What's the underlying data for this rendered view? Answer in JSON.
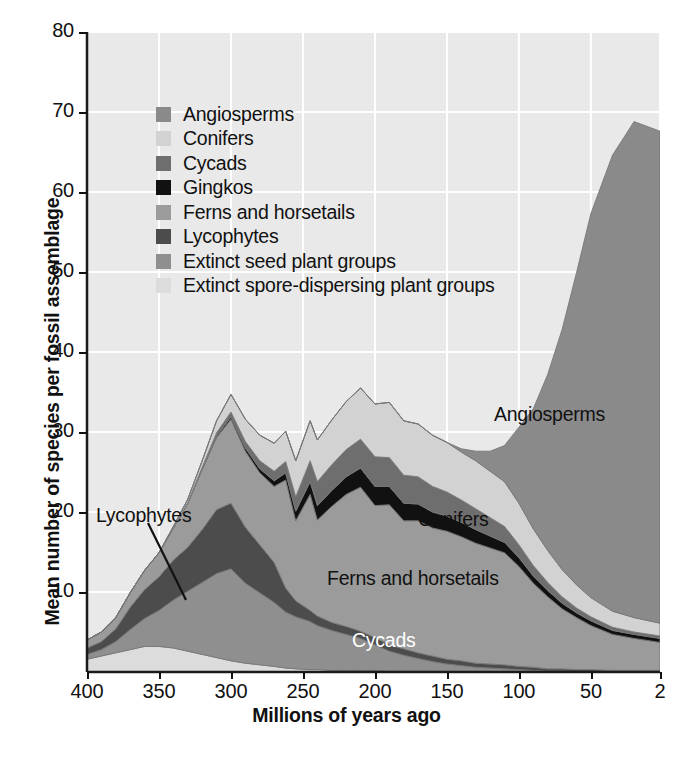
{
  "chart_data": {
    "type": "area",
    "stacked": true,
    "title": "",
    "xlabel": "Millions of years ago",
    "ylabel": "Mean number of species per fossil assemblage",
    "xlim": [
      400,
      2
    ],
    "ylim": [
      0,
      80
    ],
    "x_reversed": true,
    "grid": true,
    "legend_position": "upper-left-inside",
    "xticks": [
      400,
      350,
      300,
      250,
      200,
      150,
      100,
      50,
      2
    ],
    "yticks": [
      10,
      20,
      30,
      40,
      50,
      60,
      70,
      80
    ],
    "x": [
      400,
      390,
      380,
      370,
      360,
      350,
      340,
      330,
      320,
      310,
      300,
      290,
      280,
      270,
      262,
      255,
      245,
      240,
      230,
      220,
      210,
      200,
      190,
      180,
      170,
      160,
      150,
      140,
      130,
      120,
      110,
      100,
      90,
      80,
      70,
      60,
      50,
      35,
      20,
      2
    ],
    "series": [
      {
        "name": "Angiosperms",
        "color": "#8a8a8a",
        "values": [
          0,
          0,
          0,
          0,
          0,
          0,
          0,
          0,
          0,
          0,
          0,
          0,
          0,
          0,
          0,
          0,
          0,
          0,
          0,
          0,
          0,
          0,
          0,
          0,
          0,
          0,
          0,
          0.4,
          1.2,
          2.5,
          4.5,
          9.5,
          15.0,
          22.0,
          30.0,
          39.0,
          48.0,
          57.0,
          62.0,
          61.5
        ]
      },
      {
        "name": "Conifers",
        "color": "#d2d2d2",
        "values": [
          0,
          0,
          0,
          0,
          0,
          0,
          0.2,
          0.4,
          0.8,
          1.5,
          2.2,
          2.8,
          3.2,
          3.5,
          3.8,
          4.5,
          5.0,
          5.2,
          5.6,
          6.0,
          6.4,
          6.6,
          6.9,
          6.8,
          6.6,
          6.4,
          6.2,
          6.0,
          6.0,
          5.8,
          5.6,
          5.2,
          4.6,
          4.0,
          3.4,
          2.9,
          2.4,
          2.0,
          1.8,
          1.6
        ]
      },
      {
        "name": "Cycads",
        "color": "#6e6e6e",
        "values": [
          0,
          0,
          0,
          0,
          0,
          0,
          0,
          0.1,
          0.2,
          0.4,
          0.6,
          0.8,
          1.0,
          1.2,
          1.4,
          1.8,
          2.6,
          3.0,
          3.2,
          3.4,
          3.6,
          3.7,
          3.6,
          3.5,
          3.4,
          3.2,
          3.0,
          2.8,
          2.6,
          2.3,
          2.0,
          1.6,
          1.3,
          1.0,
          0.8,
          0.6,
          0.5,
          0.4,
          0.3,
          0.3
        ]
      },
      {
        "name": "Gingkos",
        "color": "#111111",
        "values": [
          0,
          0,
          0,
          0,
          0,
          0,
          0,
          0,
          0.1,
          0.2,
          0.3,
          0.4,
          0.5,
          0.7,
          0.9,
          1.2,
          1.6,
          1.8,
          2.0,
          2.2,
          2.4,
          2.4,
          2.3,
          2.2,
          2.1,
          2.0,
          1.9,
          1.8,
          1.7,
          1.5,
          1.3,
          1.1,
          0.9,
          0.8,
          0.7,
          0.6,
          0.6,
          0.5,
          0.5,
          0.5
        ]
      },
      {
        "name": "Ferns and horsetails",
        "color": "#9b9b9b",
        "values": [
          1.0,
          1.2,
          1.4,
          1.8,
          2.4,
          3.0,
          4.0,
          5.5,
          7.5,
          9.0,
          10.5,
          9.5,
          9.0,
          9.5,
          13.5,
          10.0,
          14.5,
          12.0,
          14.5,
          16.5,
          18.0,
          16.5,
          17.5,
          16.0,
          16.5,
          16.0,
          16.0,
          15.5,
          15.0,
          14.5,
          14.0,
          12.5,
          10.5,
          9.0,
          7.5,
          6.5,
          5.5,
          4.5,
          4.0,
          3.5
        ]
      },
      {
        "name": "Lycophytes",
        "color": "#4c4c4c",
        "values": [
          0.8,
          1.0,
          1.6,
          2.8,
          3.6,
          4.2,
          5.0,
          5.5,
          6.6,
          8.0,
          8.2,
          7.0,
          6.0,
          5.0,
          3.0,
          2.0,
          1.4,
          1.2,
          1.0,
          1.0,
          0.9,
          0.9,
          0.8,
          0.8,
          0.7,
          0.7,
          0.6,
          0.6,
          0.5,
          0.5,
          0.5,
          0.4,
          0.4,
          0.3,
          0.3,
          0.3,
          0.3,
          0.2,
          0.2,
          0.2
        ]
      },
      {
        "name": "Extinct seed plant groups",
        "color": "#8f8f8f",
        "values": [
          0.6,
          0.8,
          1.4,
          2.5,
          3.5,
          4.5,
          6.0,
          7.5,
          9.0,
          10.5,
          11.5,
          10.0,
          9.0,
          8.0,
          7.0,
          6.5,
          6.0,
          5.5,
          5.0,
          4.5,
          4.0,
          3.2,
          2.5,
          2.0,
          1.6,
          1.2,
          1.0,
          0.8,
          0.6,
          0.5,
          0.4,
          0.3,
          0.2,
          0.1,
          0.1,
          0.0,
          0.0,
          0.0,
          0.0,
          0.0
        ]
      },
      {
        "name": "Extinct spore-dispersing plant groups",
        "color": "#dcdcdc",
        "values": [
          1.6,
          2.0,
          2.4,
          2.8,
          3.2,
          3.2,
          3.0,
          2.6,
          2.2,
          1.8,
          1.4,
          1.1,
          0.9,
          0.7,
          0.5,
          0.4,
          0.3,
          0.3,
          0.2,
          0.2,
          0.2,
          0.2,
          0.1,
          0.1,
          0.1,
          0.1,
          0.0,
          0.0,
          0.0,
          0.0,
          0.0,
          0.0,
          0.0,
          0.0,
          0.0,
          0.0,
          0.0,
          0.0,
          0.0,
          0.0
        ]
      }
    ]
  },
  "axes": {
    "ylabel": "Mean number of species per fossil assemblage",
    "xlabel": "Millions of years ago",
    "yticks": [
      "80",
      "70",
      "60",
      "50",
      "40",
      "30",
      "20",
      "10"
    ],
    "xticks": [
      "400",
      "350",
      "300",
      "250",
      "200",
      "150",
      "100",
      "50",
      "2"
    ]
  },
  "legend": {
    "items": [
      {
        "label": "Angiosperms",
        "color": "#8a8a8a"
      },
      {
        "label": "Conifers",
        "color": "#d2d2d2"
      },
      {
        "label": "Cycads",
        "color": "#6e6e6e"
      },
      {
        "label": "Gingkos",
        "color": "#111111"
      },
      {
        "label": "Ferns and horsetails",
        "color": "#9b9b9b"
      },
      {
        "label": "Lycophytes",
        "color": "#4c4c4c"
      },
      {
        "label": "Extinct seed plant groups",
        "color": "#8f8f8f"
      },
      {
        "label": "Extinct spore-dispersing plant groups",
        "color": "#dcdcdc"
      }
    ]
  },
  "annotations": [
    {
      "name": "annotation-angiosperms",
      "text": "Angiosperms",
      "x": 494,
      "y": 403,
      "style": "dark"
    },
    {
      "name": "annotation-conifers",
      "text": "Conifers",
      "x": 418,
      "y": 508,
      "style": "dark"
    },
    {
      "name": "annotation-ferns",
      "text": "Ferns and horsetails",
      "x": 327,
      "y": 567,
      "style": "dark"
    },
    {
      "name": "annotation-cycads",
      "text": "Cycads",
      "x": 352,
      "y": 629,
      "style": "light"
    },
    {
      "name": "annotation-lycophytes",
      "text": "Lycophytes",
      "x": 96,
      "y": 504,
      "style": "dark"
    }
  ]
}
